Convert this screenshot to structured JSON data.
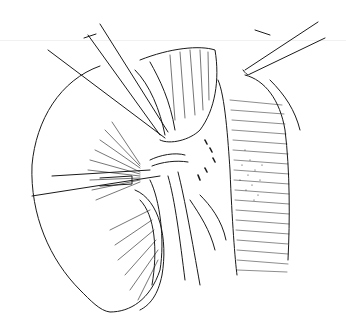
{
  "illustration": {
    "subject": "surgical line drawing: kidney with retractors and forceps near renal hilum and vessel",
    "style": "black ink line art on white",
    "colors": {
      "background": "#ffffff",
      "ink": "#1a1a1a",
      "faint": "#f1f1f1"
    }
  }
}
